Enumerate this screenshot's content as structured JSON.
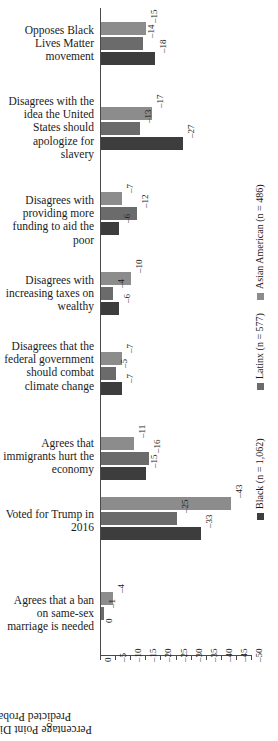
{
  "chart_data": {
    "type": "bar",
    "orientation": "horizontal-grouped",
    "title": "",
    "xlabel": "Percentage Point Differences in Predicted Probabilities",
    "ylabel": "",
    "xlim": [
      0,
      -50
    ],
    "xticks": [
      "0",
      "–5",
      "–10",
      "–15",
      "–20",
      "–25",
      "–30",
      "–35",
      "–40",
      "–45",
      "–50"
    ],
    "xtick_values": [
      0,
      -5,
      -10,
      -15,
      -20,
      -25,
      -30,
      -35,
      -40,
      -45,
      -50
    ],
    "grid": false,
    "legend_position": "right-rotated",
    "categories": [
      "Opposes Black Lives Matter movement",
      "Disagrees with the idea the United States should apologize for slavery",
      "Disagrees with providing more funding to aid the poor",
      "Disagrees with increasing taxes on wealthy",
      "Disagrees that the federal government should combat climate change",
      "Agrees that immigrants hurt the economy",
      "Voted for Trump in 2016",
      "Agrees that a ban on same-sex marriage is needed"
    ],
    "series": [
      {
        "name": "Asian American (n = 486)",
        "color": "#8c8c8c",
        "values": [
          -15,
          -17,
          -7,
          -10,
          -7,
          -11,
          -43,
          -4
        ],
        "labels": [
          "–15",
          "–17",
          "–7",
          "–10",
          "–7",
          "–11",
          "–43",
          "–4"
        ]
      },
      {
        "name": "Latinx (n = 577)",
        "color": "#6b6b6b",
        "values": [
          -14,
          -13,
          -12,
          -4,
          -5,
          -16,
          -25,
          -1
        ],
        "labels": [
          "–14",
          "–13",
          "–12",
          "–4",
          "–5",
          "–16",
          "–25",
          "–1"
        ]
      },
      {
        "name": "Black (n = 1,062)",
        "color": "#3d3d3d",
        "values": [
          -18,
          -27,
          -6,
          -6,
          -7,
          -15,
          -33,
          0
        ],
        "labels": [
          "–18",
          "–27",
          "–6",
          "–6",
          "–7",
          "–15",
          "–33",
          "0"
        ]
      }
    ]
  },
  "legend": {
    "entries": [
      {
        "label": "Black (n = 1,062)",
        "color": "#3d3d3d"
      },
      {
        "label": "Latinx (n = 577)",
        "color": "#6b6b6b"
      },
      {
        "label": "Asian American (n = 486)",
        "color": "#8c8c8c"
      }
    ]
  },
  "axis": {
    "title": "Percentage Point Differences in Predicted Probabilities"
  }
}
